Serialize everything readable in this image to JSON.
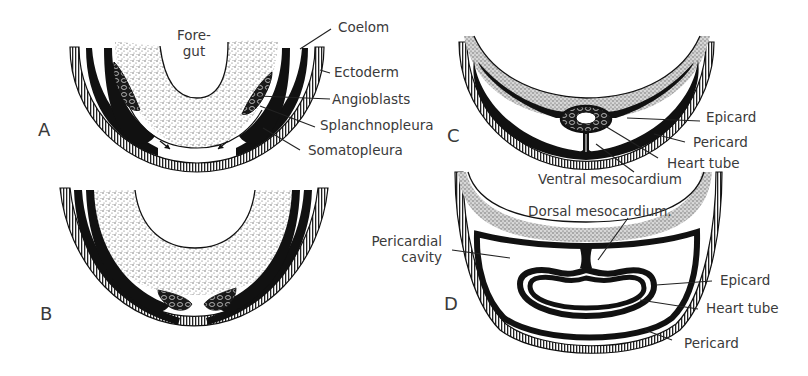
{
  "figure": {
    "colors": {
      "ink": "#111111",
      "label": "#3a3a3a",
      "stipple": "#9a9a9a",
      "background": "#ffffff"
    }
  },
  "panels": [
    {
      "letter": "A",
      "labels": {
        "foregut_line1": "Fore-",
        "foregut_line2": "gut",
        "coelom": "Coelom",
        "ectoderm": "Ectoderm",
        "angioblasts": "Angioblasts",
        "splanchnopleura": "Splanchnopleura",
        "somatopleura": "Somatopleura"
      }
    },
    {
      "letter": "B",
      "labels": {}
    },
    {
      "letter": "C",
      "labels": {
        "epicard": "Epicard",
        "pericard": "Pericard",
        "heart_tube": "Heart tube",
        "ventral_mesocardium": "Ventral mesocardium"
      }
    },
    {
      "letter": "D",
      "labels": {
        "dorsal_mesocardium": "Dorsal mesocardium.",
        "pericardial_cavity_line1": "Pericardial",
        "pericardial_cavity_line2": "cavity",
        "epicard": "Epicard",
        "heart_tube": "Heart tube",
        "pericard": "Pericard"
      }
    }
  ]
}
